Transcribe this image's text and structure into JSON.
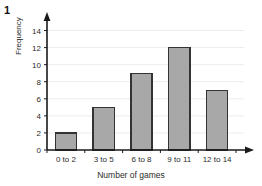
{
  "question_number": "1",
  "chart_data": {
    "type": "bar",
    "title": "",
    "subtitle": "",
    "xlabel": "Number of games",
    "ylabel": "Frequency",
    "categories": [
      "0 to 2",
      "3 to 5",
      "6 to 8",
      "9 to 11",
      "12 to 14"
    ],
    "values": [
      2,
      5,
      9,
      12,
      7
    ],
    "series": [
      {
        "name": "Frequency",
        "values": [
          2,
          5,
          9,
          12,
          7
        ]
      }
    ],
    "ylim": [
      0,
      15
    ],
    "yticks": [
      0,
      2,
      4,
      6,
      8,
      10,
      12,
      14
    ],
    "ytick_labels": [
      "0",
      "2",
      "4",
      "6",
      "8",
      "10",
      "12",
      "14"
    ],
    "xtick_labels": [
      "0 to 2",
      "3 to 5",
      "6 to 8",
      "9 to 11",
      "12 to 14"
    ],
    "grid": "horizontal",
    "legend": "none",
    "annotations": [],
    "colors": {
      "bar_fill": "#a8a8a8",
      "bar_stroke": "#333333",
      "axis": "#1a1a1a",
      "gridline": "#ececec",
      "text": "#2b2b2b",
      "background": "#ffffff"
    }
  }
}
